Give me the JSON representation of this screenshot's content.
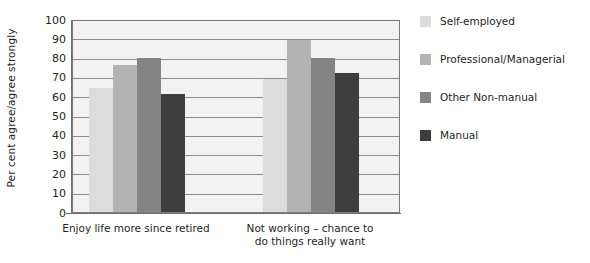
{
  "chart_data": {
    "type": "bar",
    "title": "",
    "xlabel": "",
    "ylabel": "Per cent agree/agree strongly",
    "ylim": [
      0,
      100
    ],
    "ytick_step": 10,
    "yticks": [
      100,
      90,
      80,
      70,
      60,
      50,
      40,
      30,
      20,
      10,
      0
    ],
    "grid": true,
    "legend_position": "right",
    "categories": [
      "Enjoy life more since retired",
      "Not working – chance to do things really want"
    ],
    "category_lines": [
      [
        "Enjoy life more since retired"
      ],
      [
        "Not working – chance to",
        "do things really want"
      ]
    ],
    "series": [
      {
        "name": "Self-employed",
        "color": "#dcdcdc",
        "values": [
          64,
          69
        ]
      },
      {
        "name": "Professional/Managerial",
        "color": "#b3b3b3",
        "values": [
          76,
          89
        ]
      },
      {
        "name": "Other Non-manual",
        "color": "#848484",
        "values": [
          80,
          80
        ]
      },
      {
        "name": "Manual",
        "color": "#3d3d3d",
        "values": [
          61,
          72
        ]
      }
    ],
    "plot_background": "#f2f2f2",
    "gridline_color": "#8c8c8c",
    "axis_color": "#6f6f6f"
  }
}
